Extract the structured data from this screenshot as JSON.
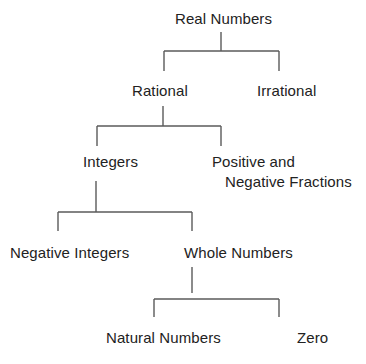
{
  "diagram": {
    "type": "tree",
    "nodes": {
      "real": "Real Numbers",
      "rational": "Rational",
      "irrational": "Irrational",
      "integers": "Integers",
      "fractions_line1": "Positive and",
      "fractions_line2": "Negative Fractions",
      "negative_integers": "Negative Integers",
      "whole": "Whole Numbers",
      "natural": "Natural Numbers",
      "zero": "Zero"
    },
    "edges": [
      {
        "from": "Real Numbers",
        "to": "Rational"
      },
      {
        "from": "Real Numbers",
        "to": "Irrational"
      },
      {
        "from": "Rational",
        "to": "Integers"
      },
      {
        "from": "Rational",
        "to": "Positive and Negative Fractions"
      },
      {
        "from": "Integers",
        "to": "Negative Integers"
      },
      {
        "from": "Integers",
        "to": "Whole Numbers"
      },
      {
        "from": "Whole Numbers",
        "to": "Natural Numbers"
      },
      {
        "from": "Whole Numbers",
        "to": "Zero"
      }
    ],
    "line_color": "#5a5a5a",
    "text_color": "#222222"
  }
}
